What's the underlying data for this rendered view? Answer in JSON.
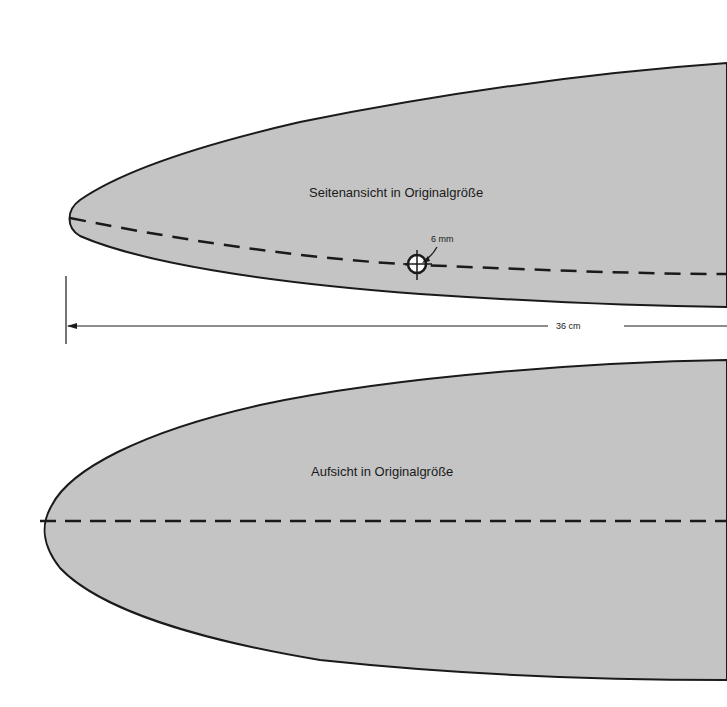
{
  "side_view": {
    "title": "Seitenansicht in Originalgröße",
    "hole_label": "6 mm"
  },
  "dimension": {
    "label": "36 cm"
  },
  "top_view": {
    "title": "Aufsicht in Originalgröße"
  },
  "colors": {
    "fill": "#c4c4c4",
    "stroke": "#1a1a1a",
    "background": "#ffffff"
  }
}
